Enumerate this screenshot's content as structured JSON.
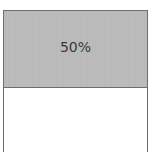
{
  "chart_data": {
    "type": "bar",
    "orientation": "vertical-stacked",
    "categories": [
      "filled",
      "remaining"
    ],
    "values": [
      50,
      50
    ],
    "labels": [
      "50%",
      ""
    ],
    "colors": {
      "filled": "#b9b9b9",
      "remaining": "#ffffff",
      "border": "#6e6e6e",
      "label": "#3a3a3a"
    },
    "title": "",
    "xlabel": "",
    "ylabel": "",
    "ylim": [
      0,
      100
    ],
    "grid": false,
    "legend": "none"
  },
  "top_fragment": ""
}
